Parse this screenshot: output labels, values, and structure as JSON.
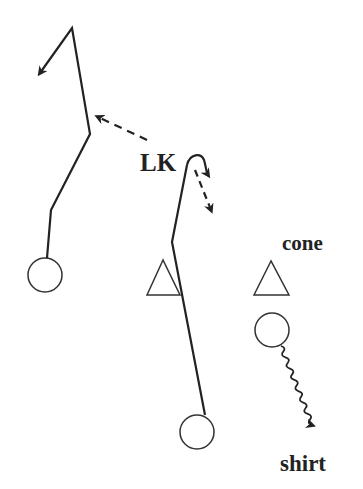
{
  "diagram": {
    "type": "play-diagram",
    "labels": {
      "lk": "LK",
      "cone": "cone",
      "shirt": "shirt"
    },
    "colors": {
      "background": "#ffffff",
      "ink": "#222222"
    },
    "nodes": [
      {
        "id": "player-left",
        "shape": "circle",
        "cx": 45,
        "cy": 275,
        "r": 17
      },
      {
        "id": "player-bottom",
        "shape": "circle",
        "cx": 197,
        "cy": 432,
        "r": 17
      },
      {
        "id": "player-right",
        "shape": "circle",
        "cx": 272,
        "cy": 330,
        "r": 17
      },
      {
        "id": "cone-middle",
        "shape": "triangle"
      },
      {
        "id": "cone-right",
        "shape": "triangle"
      }
    ],
    "paths": [
      {
        "id": "left-run",
        "style": "solid",
        "from": "player-left",
        "ends": "arrow"
      },
      {
        "id": "lk-pass",
        "style": "dashed",
        "from": "LK",
        "ends": "arrow"
      },
      {
        "id": "bottom-run",
        "style": "solid",
        "from": "player-bottom",
        "ends": "curl"
      },
      {
        "id": "lk-dash",
        "style": "dashed",
        "from": "LK",
        "ends": "arrow"
      },
      {
        "id": "shirt-dribble",
        "style": "wavy",
        "from": "player-right",
        "ends": "arrow"
      }
    ]
  }
}
